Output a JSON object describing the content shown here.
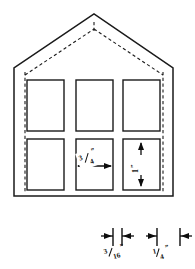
{
  "drawing": {
    "title": "House Facade Elevation with Dimensions",
    "type": "technical-line-drawing",
    "canvas": {
      "width": 195,
      "height": 269
    },
    "ink_color": "#1a1a1a",
    "background_color": "#ffffff"
  },
  "structure": {
    "name": "gable-front-elevation",
    "wall_left_x": 14,
    "wall_right_x": 173,
    "eave_y": 68,
    "base_y": 196,
    "ridge_x": 94,
    "ridge_y": 14,
    "roof_line_style": "solid",
    "inner_roof_line_style": "dashed",
    "wall_inset": 14
  },
  "windows": {
    "rows": 2,
    "columns": 3,
    "count": 6,
    "fill": "#ffffff",
    "items": [
      {
        "name": "window-top-left",
        "x": 27,
        "y": 80,
        "w": 37,
        "h": 51
      },
      {
        "name": "window-top-center",
        "x": 76,
        "y": 80,
        "w": 37,
        "h": 51
      },
      {
        "name": "window-top-right",
        "x": 123,
        "y": 80,
        "w": 37,
        "h": 51
      },
      {
        "name": "window-bottom-left",
        "x": 27,
        "y": 139,
        "w": 37,
        "h": 51
      },
      {
        "name": "window-bottom-center",
        "x": 76,
        "y": 139,
        "w": 37,
        "h": 51
      },
      {
        "name": "window-bottom-right",
        "x": 123,
        "y": 139,
        "w": 37,
        "h": 51
      }
    ]
  },
  "dimensions": {
    "window_width": {
      "name": "window-width-dimension",
      "value": "3/4",
      "numerator": "3",
      "denominator": "4",
      "unit": "”",
      "full_label": "3/4”",
      "orientation": "horizontal",
      "applies_to": "window-bottom-center"
    },
    "window_height": {
      "name": "window-height-dimension",
      "value": "1",
      "unit": "”",
      "full_label": "1”",
      "orientation": "vertical",
      "applies_to": "window-bottom-right"
    },
    "detail_a": {
      "name": "mullion-width-detail",
      "value": "3/16",
      "numerator": "3",
      "denominator": "16",
      "unit": "”",
      "full_label": "3/16”",
      "orientation": "horizontal"
    },
    "detail_b": {
      "name": "frame-width-detail",
      "value": "1/4",
      "numerator": "1",
      "denominator": "4",
      "unit": "”",
      "full_label": "1/4”",
      "orientation": "horizontal"
    }
  },
  "icons": {
    "arrow_left": "arrow-left-icon",
    "arrow_right": "arrow-right-icon",
    "arrow_up": "arrow-up-icon",
    "arrow_down": "arrow-down-icon"
  }
}
